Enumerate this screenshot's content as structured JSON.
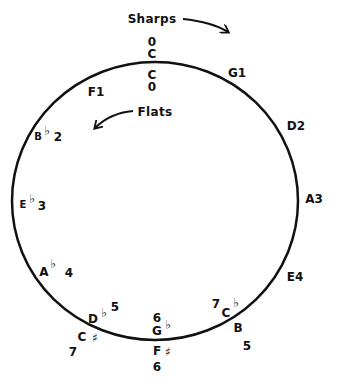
{
  "annotations": {
    "sharps": "Sharps",
    "flats": "Flats"
  },
  "circle": {
    "cx": 155,
    "cy": 201,
    "rx": 143,
    "ry": 139,
    "stroke": "#111111"
  },
  "keys": {
    "c_top_count": "0",
    "c_top_note": "C",
    "c_inner_note": "C",
    "c_inner_count": "0",
    "g": "G1",
    "d": "D2",
    "a": "A3",
    "e": "E4",
    "b_note": "B",
    "b_count": "5",
    "cb_count": "7",
    "cb_note": "C",
    "cb_acc": "♭",
    "gb_count": "6",
    "gb_note": "G",
    "gb_acc": "♭",
    "fs_note": "F",
    "fs_acc": "♯",
    "fs_count": "6",
    "db_note": "D",
    "db_acc": "♭",
    "db_count": "5",
    "cs_note": "C",
    "cs_acc": "♯",
    "cs_count": "7",
    "ab_note": "A",
    "ab_acc": "♭",
    "ab_count": "4",
    "eb_note": "E",
    "eb_acc": "♭",
    "eb_count": "3",
    "bb_note": "B",
    "bb_acc": "♭",
    "bb_count": "2",
    "f": "F1"
  }
}
